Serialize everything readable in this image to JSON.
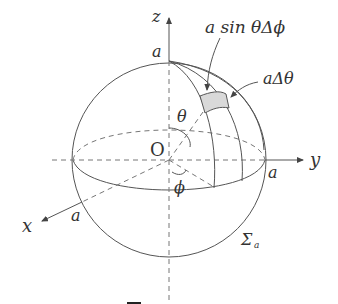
{
  "figure": {
    "labels": {
      "z_axis": "z",
      "y_axis": "y",
      "x_axis": "x",
      "origin": "O",
      "top_radius": "a",
      "right_radius": "a",
      "front_radius": "a",
      "theta": "θ",
      "phi": "ϕ",
      "arc_phi": "a sin θΔϕ",
      "arc_theta": "aΔθ",
      "surface_sigma": "Σ",
      "surface_sub": "a"
    },
    "colors": {
      "stroke": "#555555",
      "dash": "#777777",
      "patch": "#d9d9d9",
      "text": "#333333"
    }
  }
}
